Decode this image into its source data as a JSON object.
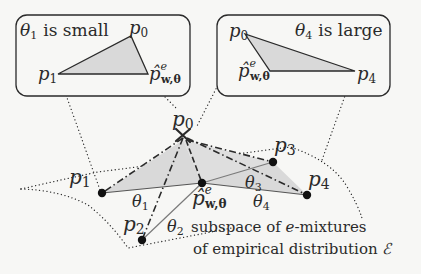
{
  "diagram": {
    "inset_left": {
      "caption_symbol": "θ",
      "caption_sub": "1",
      "caption_text": "is small",
      "label_p0": "p",
      "label_p0_sub": "0",
      "label_p1": "p",
      "label_p1_sub": "1",
      "label_phat": "p̂",
      "label_phat_sup": "e",
      "label_phat_sub": "w,θ"
    },
    "inset_right": {
      "caption_symbol": "θ",
      "caption_sub": "4",
      "caption_text": "is large",
      "label_p0": "p",
      "label_p0_sub": "0",
      "label_p4": "p",
      "label_p4_sub": "4",
      "label_phat": "p̂",
      "label_phat_sup": "e",
      "label_phat_sub": "w,θ"
    },
    "main": {
      "p0": {
        "base": "p",
        "sub": "0"
      },
      "p1": {
        "base": "p",
        "sub": "1"
      },
      "p2": {
        "base": "p",
        "sub": "2"
      },
      "p3": {
        "base": "p",
        "sub": "3"
      },
      "p4": {
        "base": "p",
        "sub": "4"
      },
      "phat": {
        "base": "p̂",
        "sup": "e",
        "sub": "w,θ"
      },
      "angles": [
        {
          "base": "θ",
          "sub": "1"
        },
        {
          "base": "θ",
          "sub": "2"
        },
        {
          "base": "θ",
          "sub": "3"
        },
        {
          "base": "θ",
          "sub": "4"
        }
      ],
      "subspace_line1": "subspace of e-mixtures",
      "subspace_line1_a": "subspace of ",
      "subspace_line1_e": "e",
      "subspace_line1_b": "-mixtures",
      "subspace_line2_a": "of empirical distribution ",
      "subspace_line2_sym": "ℰ"
    },
    "colors": {
      "background": "#f7f7f5",
      "ink": "#2a2a2a",
      "shade": "#d9d9d9",
      "thin_line": "#8a8a8a"
    }
  }
}
